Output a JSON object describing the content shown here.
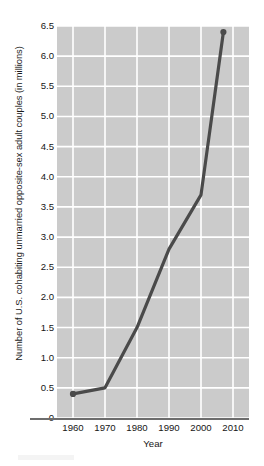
{
  "chart_data": {
    "type": "line",
    "title": "",
    "xlabel": "Year",
    "ylabel": "Number of U.S. cohabiting unmarried opposite-sex adult couples (in millions)",
    "x": [
      1960,
      1970,
      1980,
      1990,
      2000,
      2007
    ],
    "values": [
      0.4,
      0.5,
      1.5,
      2.8,
      3.7,
      6.4
    ],
    "series": [
      {
        "name": "Cohabiting unmarried opposite-sex adult couples",
        "values": [
          0.4,
          0.5,
          1.5,
          2.8,
          3.7,
          6.4
        ]
      }
    ],
    "xlim": [
      1955,
      2015
    ],
    "ylim": [
      0,
      6.5
    ],
    "xticks": [
      1960,
      1970,
      1980,
      1990,
      2000,
      2010
    ],
    "xtick_labels": [
      "1960",
      "1970",
      "1980",
      "1990",
      "2000",
      "2010"
    ],
    "yticks": [
      0,
      0.5,
      1.0,
      1.5,
      2.0,
      2.5,
      3.0,
      3.5,
      4.0,
      4.5,
      5.0,
      5.5,
      6.0,
      6.5
    ],
    "ytick_labels": [
      "0",
      "0.5",
      "1.0",
      "1.5",
      "2.0",
      "2.5",
      "3.0",
      "3.5",
      "4.0",
      "4.5",
      "5.0",
      "5.5",
      "6.0",
      "6.5"
    ],
    "grid": true,
    "grid_color": "#ffffff",
    "plot_background": "#cbcbcb",
    "line_color": "#4a4a4a",
    "marker": "circle",
    "legend": "none",
    "annotations": []
  },
  "axes": {
    "y_title": "Number of U.S. cohabiting unmarried opposite-sex adult couples (in millions)",
    "x_title": "Year"
  }
}
